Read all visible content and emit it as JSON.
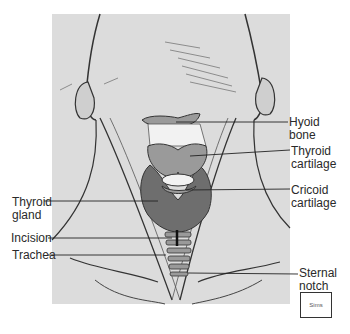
{
  "figure": {
    "labels": {
      "hyoid_bone": "Hyoid\nbone",
      "thyroid_cartilage": "Thyroid\ncartilage",
      "cricoid_cartilage": "Cricoid\ncartilage",
      "thyroid_gland": "Thyroid\ngland",
      "incision": "Incision",
      "trachea": "Trachea",
      "sternal_notch": "Sternal\nnotch"
    },
    "credit": "Sims",
    "colors": {
      "background": "#ffffff",
      "skin": "#dcdcdc",
      "line": "#2a2a2a",
      "thyroid_gland": "#6e6e6e",
      "cartilage": "#9a9a9a",
      "bone": "#f2f2f2"
    }
  }
}
